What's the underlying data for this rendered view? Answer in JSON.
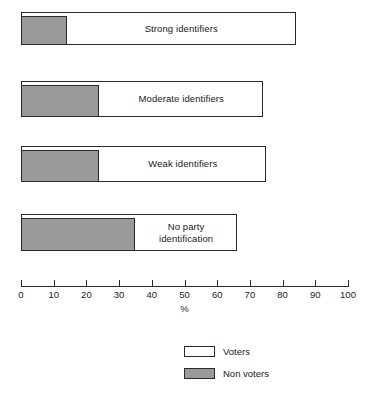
{
  "chart_data": {
    "type": "bar",
    "orientation": "horizontal",
    "title": "",
    "xlabel": "%",
    "ylabel": "",
    "xlim": [
      0,
      100
    ],
    "xticks": [
      0,
      10,
      20,
      30,
      40,
      50,
      60,
      70,
      80,
      90,
      100
    ],
    "tick_labels": [
      "0",
      "10",
      "20",
      "30",
      "40",
      "50",
      "60",
      "70",
      "80",
      "90",
      "100"
    ],
    "grid": false,
    "legend_position": "bottom-center",
    "categories": [
      "Strong identifiers",
      "Moderate identifiers",
      "Weak identifiers",
      "No party\nidentification"
    ],
    "series": [
      {
        "name": "Non voters",
        "color": "#9a9a9a",
        "values": [
          14,
          24,
          24,
          35
        ]
      },
      {
        "name": "Voters",
        "color": "#ffffff",
        "values": [
          70,
          50,
          51,
          31
        ]
      }
    ],
    "totals": [
      84,
      74,
      75,
      66
    ],
    "bars": [
      {
        "label": "Strong identifiers",
        "total": 84,
        "non_voters": 14
      },
      {
        "label": "Moderate identifiers",
        "total": 74,
        "non_voters": 24
      },
      {
        "label": "Weak identifiers",
        "total": 75,
        "non_voters": 24
      },
      {
        "label": "No party\nidentification",
        "total": 66,
        "non_voters": 35
      }
    ],
    "legend": [
      {
        "label": "Voters",
        "color": "#ffffff"
      },
      {
        "label": "Non voters",
        "color": "#9a9a9a"
      }
    ]
  },
  "colors": {
    "voters": "#ffffff",
    "non_voters": "#9a9a9a",
    "outline": "#2a2a2a",
    "background": "#ffffff"
  }
}
